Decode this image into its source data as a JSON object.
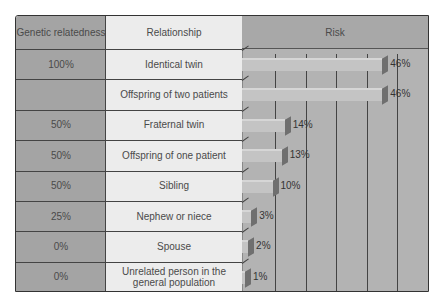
{
  "headers": {
    "genetic": "Genetic relatedness",
    "relationship": "Relationship",
    "risk": "Risk"
  },
  "rows": [
    {
      "genetic": "100%",
      "relationship": "Identical twin",
      "risk_label": "46%"
    },
    {
      "genetic": "",
      "relationship": "Offspring of two patients",
      "risk_label": "46%"
    },
    {
      "genetic": "50%",
      "relationship": "Fraternal twin",
      "risk_label": "14%"
    },
    {
      "genetic": "50%",
      "relationship": "Offspring of one patient",
      "risk_label": "13%"
    },
    {
      "genetic": "50%",
      "relationship": "Sibling",
      "risk_label": "10%"
    },
    {
      "genetic": "25%",
      "relationship": "Nephew or niece",
      "risk_label": "3%"
    },
    {
      "genetic": "0%",
      "relationship": "Spouse",
      "risk_label": "2%"
    },
    {
      "genetic": "0%",
      "relationship": "Unrelated person in the general population",
      "risk_label": "1%"
    }
  ],
  "colors": {
    "genetic_col": "#a4a4a4",
    "relationship_col": "#ececec",
    "risk_col": "#b3b3b3",
    "bar": "#c4c4c4",
    "bar_cap": "#6f6f6f"
  },
  "chart_data": {
    "type": "bar",
    "orientation": "horizontal",
    "title": "Risk",
    "categories": [
      "Identical twin",
      "Offspring of two patients",
      "Fraternal twin",
      "Offspring of one patient",
      "Sibling",
      "Nephew or niece",
      "Spouse",
      "Unrelated person in the general population"
    ],
    "genetic_relatedness": [
      "100%",
      "",
      "50%",
      "50%",
      "50%",
      "25%",
      "0%",
      "0%"
    ],
    "values": [
      46,
      46,
      14,
      13,
      10,
      3,
      2,
      1
    ],
    "value_labels": [
      "46%",
      "46%",
      "14%",
      "13%",
      "10%",
      "3%",
      "2%",
      "1%"
    ],
    "xlabel": "",
    "ylabel": "",
    "xlim": [
      0,
      60
    ],
    "grid": true,
    "gridline_interval": 10,
    "legend": "none"
  }
}
